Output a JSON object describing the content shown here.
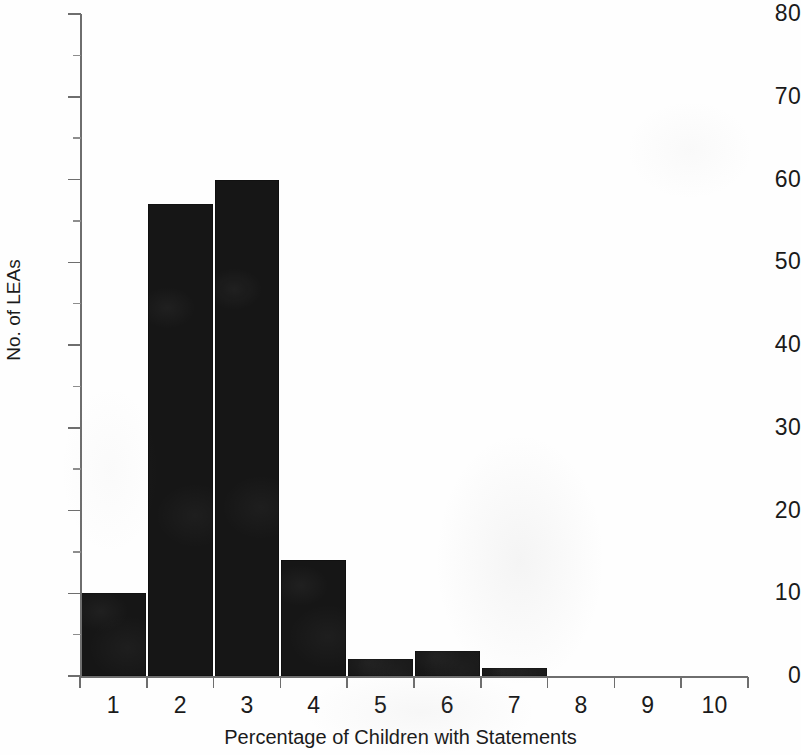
{
  "chart_data": {
    "type": "bar",
    "title": "",
    "subtitle": "",
    "xlabel": "Percentage of Children with Statements",
    "ylabel": "No. of LEAs",
    "categories": [
      "1",
      "2",
      "3",
      "4",
      "5",
      "6",
      "7",
      "8",
      "9",
      "10"
    ],
    "values": [
      10,
      57,
      60,
      14,
      2,
      3,
      1,
      0,
      0,
      0
    ],
    "series": [
      {
        "name": "No. of LEAs",
        "values": [
          10,
          57,
          60,
          14,
          2,
          3,
          1,
          0,
          0,
          0
        ],
        "color": "#161616"
      }
    ],
    "xlim": [
      0,
      10
    ],
    "ylim": [
      0,
      80
    ],
    "y_tick_labels": [
      "0",
      "10",
      "20",
      "30",
      "40",
      "50",
      "60",
      "70",
      "80"
    ],
    "y_tick_values": [
      0,
      10,
      20,
      30,
      40,
      50,
      60,
      70,
      80
    ],
    "y_minor_tick_values": [
      5,
      15,
      25,
      35,
      45,
      55,
      65,
      75
    ],
    "x_tick_labels": [
      "1",
      "2",
      "3",
      "4",
      "5",
      "6",
      "7",
      "8",
      "9",
      "10"
    ],
    "grid": false,
    "legend": false,
    "legend_position": "none",
    "bar_style": "histogram-contiguous",
    "annotations": []
  },
  "figure": {
    "axis_color": "#6e6e6e",
    "bar_color": "#161616",
    "background_color": "#ffffff",
    "text_color": "#1a1a1a"
  }
}
